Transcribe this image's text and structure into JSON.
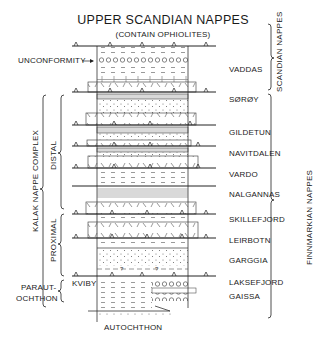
{
  "title": "UPPER SCANDIAN NAPPES",
  "subtitle": "(CONTAIN OPHIOLITES)",
  "annotations": {
    "unconformity": "UNCONFORMITY",
    "autochthon": "AUTOCHTHON",
    "kviby": "KVIBY"
  },
  "groups_left": {
    "kalak": "KALAK NAPPE COMPLEX",
    "distal": "DISTAL",
    "proximal": "PROXIMAL",
    "parautochthon_1": "PARAUT-",
    "parautochthon_2": "OCHTHON"
  },
  "groups_right": {
    "scandian": "SCANDIAN NAPPES",
    "finnmarkian": "FINNMARKIAN NAPPES"
  },
  "units": [
    {
      "name": "VADDAS",
      "y": 70
    },
    {
      "name": "SØRØY",
      "y": 100
    },
    {
      "name": "GILDETUN",
      "y": 133
    },
    {
      "name": "NAVITDALEN",
      "y": 154
    },
    {
      "name": "VARDO",
      "y": 175
    },
    {
      "name": "NALGANNAS",
      "y": 195
    },
    {
      "name": "SKILLEFJORD",
      "y": 220
    },
    {
      "name": "LEIRBOTN",
      "y": 241
    },
    {
      "name": "GARGGIA",
      "y": 261
    },
    {
      "name": "LAKSEFJORD",
      "y": 283
    },
    {
      "name": "GAISSA",
      "y": 297
    }
  ],
  "thrust_lines_y": [
    46,
    92,
    125,
    146,
    168,
    186,
    214,
    238,
    276
  ],
  "colors": {
    "ink": "#1a1a1a",
    "light_fill": "#d8d8d8",
    "background": "#ffffff"
  }
}
